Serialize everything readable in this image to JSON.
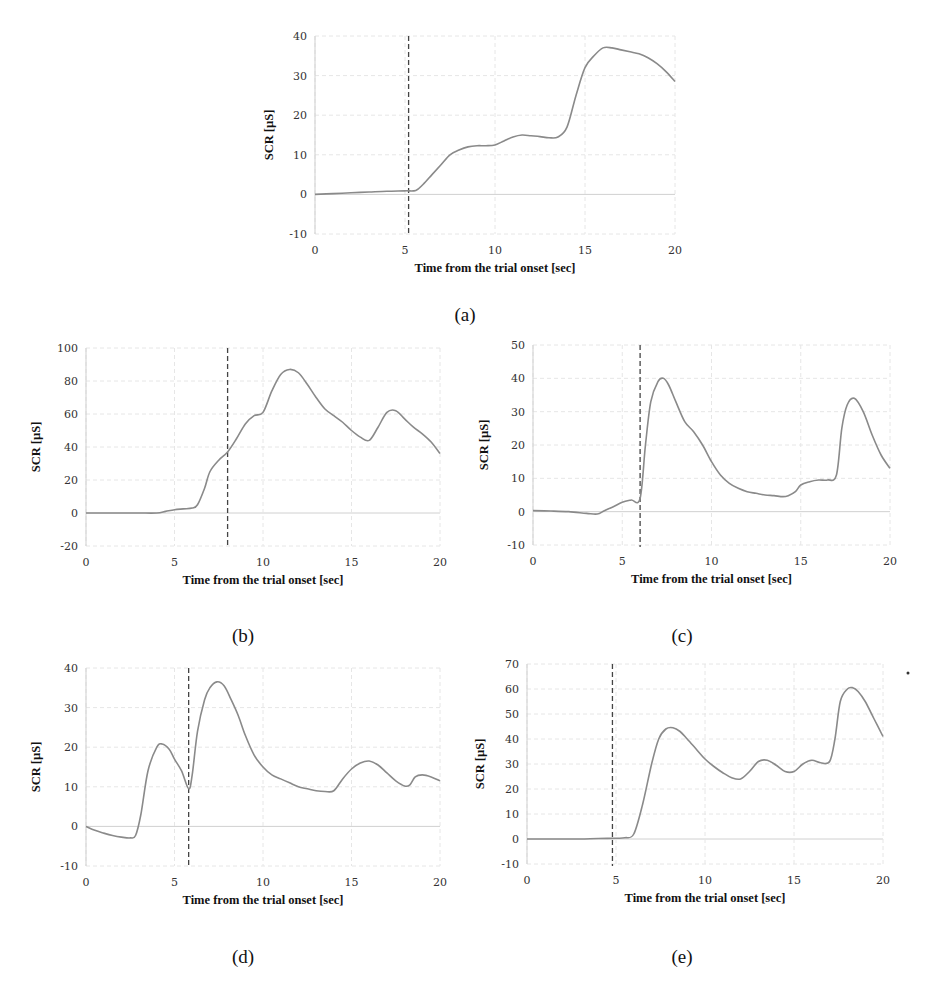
{
  "chart_data": [
    {
      "id": "a",
      "type": "line",
      "panel_label": "(a)",
      "title": "",
      "xlabel": "Time from the trial onset [sec]",
      "ylabel": "SCR [µS]",
      "xlim": [
        0,
        20
      ],
      "ylim": [
        -10,
        40
      ],
      "xticks": [
        0,
        5,
        10,
        15,
        20
      ],
      "yticks": [
        -10,
        0,
        10,
        20,
        30,
        40
      ],
      "grid": true,
      "onset_marker_x": 5.2,
      "series": [
        {
          "name": "SCR",
          "x": [
            0,
            1,
            2,
            3,
            4,
            5,
            5.6,
            6,
            6.5,
            7,
            7.5,
            8,
            8.5,
            9,
            9.5,
            10,
            10.5,
            11,
            11.5,
            12,
            12.5,
            13,
            13.5,
            14,
            14.5,
            15,
            15.5,
            16,
            16.5,
            17,
            17.5,
            18,
            18.5,
            19,
            19.5,
            20
          ],
          "values": [
            0,
            0.2,
            0.4,
            0.6,
            0.8,
            0.9,
            1,
            2.5,
            5,
            7.5,
            10,
            11.2,
            12,
            12.3,
            12.3,
            12.5,
            13.5,
            14.5,
            15,
            14.8,
            14.6,
            14.3,
            14.5,
            17,
            25,
            32,
            35,
            37,
            37,
            36.5,
            36,
            35.5,
            34.5,
            33,
            31,
            28.5
          ]
        }
      ]
    },
    {
      "id": "b",
      "type": "line",
      "panel_label": "(b)",
      "title": "",
      "xlabel": "Time from the trial onset [sec]",
      "ylabel": "SCR [µS]",
      "xlim": [
        0,
        20
      ],
      "ylim": [
        -20,
        100
      ],
      "xticks": [
        0,
        5,
        10,
        15,
        20
      ],
      "yticks": [
        -20,
        0,
        20,
        40,
        60,
        80,
        100
      ],
      "grid": true,
      "onset_marker_x": 8,
      "series": [
        {
          "name": "SCR",
          "x": [
            0,
            1,
            2,
            3,
            4,
            4.5,
            5,
            5.5,
            6,
            6.3,
            6.7,
            7,
            7.5,
            8,
            8.5,
            9,
            9.5,
            10,
            10.5,
            11,
            11.5,
            12,
            12.5,
            13,
            13.5,
            14,
            14.5,
            15,
            15.5,
            16,
            16.5,
            17,
            17.5,
            18,
            18.5,
            19,
            19.5,
            20
          ],
          "values": [
            0,
            0,
            0,
            0,
            0,
            1,
            2,
            2.5,
            3,
            5,
            15,
            25,
            32,
            37,
            45,
            54,
            59,
            61,
            74,
            84,
            87,
            85,
            78,
            70,
            63,
            59,
            55,
            50,
            46,
            44,
            52,
            61,
            62,
            57,
            52,
            48,
            43,
            36
          ]
        }
      ]
    },
    {
      "id": "c",
      "type": "line",
      "panel_label": "(c)",
      "title": "",
      "xlabel": "Time from the trial onset [sec]",
      "ylabel": "SCR [µS]",
      "xlim": [
        0,
        20
      ],
      "ylim": [
        -10,
        50
      ],
      "xticks": [
        0,
        5,
        10,
        15,
        20
      ],
      "yticks": [
        -10,
        0,
        10,
        20,
        30,
        40,
        50
      ],
      "grid": true,
      "onset_marker_x": 6,
      "series": [
        {
          "name": "SCR",
          "x": [
            0,
            1,
            2,
            3,
            3.6,
            4,
            4.5,
            5,
            5.5,
            6,
            6.3,
            6.6,
            7,
            7.3,
            7.6,
            8,
            8.5,
            9,
            9.5,
            10,
            10.5,
            11,
            11.5,
            12,
            12.5,
            13,
            13.5,
            14,
            14.3,
            14.7,
            15,
            15.5,
            16,
            16.5,
            17,
            17.3,
            17.6,
            18,
            18.5,
            19,
            19.5,
            20
          ],
          "values": [
            0.3,
            0.2,
            0,
            -0.5,
            -0.7,
            0.3,
            1.5,
            2.8,
            3.5,
            4,
            20,
            33,
            39,
            40,
            38,
            33,
            27,
            24,
            20,
            15,
            11,
            8.5,
            7,
            6,
            5.5,
            5,
            4.8,
            4.5,
            4.8,
            6,
            8,
            9,
            9.5,
            9.5,
            11,
            25,
            32,
            34,
            30,
            23,
            17,
            13
          ]
        }
      ]
    },
    {
      "id": "d",
      "type": "line",
      "panel_label": "(d)",
      "title": "",
      "xlabel": "Time from the trial onset [sec]",
      "ylabel": "SCR [µS]",
      "xlim": [
        0,
        20
      ],
      "ylim": [
        -10,
        40
      ],
      "xticks": [
        0,
        5,
        10,
        15,
        20
      ],
      "yticks": [
        -10,
        0,
        10,
        20,
        30,
        40
      ],
      "grid": true,
      "onset_marker_x": 5.8,
      "series": [
        {
          "name": "SCR",
          "x": [
            0,
            0.5,
            1,
            1.5,
            2,
            2.5,
            2.8,
            3.1,
            3.5,
            4,
            4.3,
            4.7,
            5,
            5.4,
            5.8,
            6,
            6.3,
            6.7,
            7,
            7.4,
            7.8,
            8.2,
            8.6,
            9,
            9.5,
            10,
            10.5,
            11,
            11.5,
            12,
            12.5,
            13,
            13.5,
            14,
            14.5,
            15,
            15.5,
            16,
            16.5,
            17,
            17.5,
            18,
            18.3,
            18.6,
            19,
            19.5,
            20
          ],
          "values": [
            0,
            -1,
            -1.7,
            -2.3,
            -2.7,
            -2.9,
            -2.3,
            3,
            14,
            20,
            20.8,
            19.5,
            17,
            14,
            9.5,
            13,
            24,
            32,
            35,
            36.5,
            35.5,
            32,
            28,
            23,
            18,
            15,
            13,
            12,
            11,
            10,
            9.5,
            9,
            8.8,
            9,
            12,
            14.5,
            16,
            16.5,
            15.5,
            13.5,
            11.5,
            10.2,
            10.5,
            12.5,
            13,
            12.5,
            11.5
          ]
        }
      ]
    },
    {
      "id": "e",
      "type": "line",
      "panel_label": "(e)",
      "title": "",
      "xlabel": "Time from the trial onset [sec]",
      "ylabel": "SCR [µS]",
      "xlim": [
        0,
        20
      ],
      "ylim": [
        -10,
        70
      ],
      "xticks": [
        0,
        5,
        10,
        15,
        20
      ],
      "yticks": [
        -10,
        0,
        10,
        20,
        30,
        40,
        50,
        60,
        70
      ],
      "grid": true,
      "onset_marker_x": 4.8,
      "series": [
        {
          "name": "SCR",
          "x": [
            0,
            1,
            2,
            3,
            4,
            5,
            5.5,
            6,
            6.5,
            7,
            7.4,
            7.8,
            8.2,
            8.6,
            9,
            9.5,
            10,
            10.5,
            11,
            11.5,
            12,
            12.5,
            13,
            13.5,
            14,
            14.5,
            15,
            15.5,
            16,
            16.5,
            17,
            17.3,
            17.6,
            18,
            18.3,
            18.6,
            19,
            19.5,
            20
          ],
          "values": [
            0,
            0,
            0,
            0,
            0.2,
            0.3,
            0.5,
            2,
            14,
            30,
            40,
            44,
            44.5,
            43,
            40,
            36,
            32,
            29,
            26.5,
            24.5,
            24,
            27,
            31,
            31.5,
            29.5,
            27,
            27,
            30,
            31.5,
            30.5,
            31,
            40,
            55,
            60,
            60.5,
            59,
            55,
            48,
            41
          ]
        }
      ]
    }
  ],
  "panels": {
    "a": {
      "label": "(a)"
    },
    "b": {
      "label": "(b)"
    },
    "c": {
      "label": "(c)"
    },
    "d": {
      "label": "(d)"
    },
    "e": {
      "label": "(e)"
    }
  },
  "axis_text": {
    "xlabel": "Time from the trial onset [sec]",
    "ylabel": "SCR [µS]"
  },
  "colors": {
    "line": "#8a8a8a",
    "onset_marker": "#444444",
    "grid": "#e6e6e6",
    "axis": "#cfcfcf"
  }
}
